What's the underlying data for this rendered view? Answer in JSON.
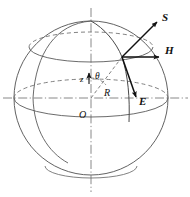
{
  "figure": {
    "kind": "sphere-vector-diagram",
    "title": "",
    "background": "#ffffff",
    "stroke_color": "#555555",
    "axis_color": "#777777",
    "vector_color": "#111111",
    "text_color": "#111111"
  },
  "sphere": {
    "center_x": 91,
    "center_y": 98,
    "radius": 77,
    "outline_style": "solid",
    "latitude_circles": [
      {
        "name": "upper-latitude",
        "cy": 47,
        "rx": 62,
        "ry": 15,
        "front": "solid",
        "back": "dashed"
      },
      {
        "name": "equator",
        "cy": 98,
        "rx": 77,
        "ry": 19,
        "front": "solid",
        "back": "dashed"
      },
      {
        "name": "lower-latitude",
        "cy": 168,
        "rx": 46,
        "ry": 12,
        "front": "solid",
        "back": "none"
      }
    ]
  },
  "axes": [
    {
      "name": "z-axis",
      "orientation": "vertical",
      "style": "dash-dot",
      "x": 91,
      "y1": 8,
      "y2": 192
    },
    {
      "name": "horizontal-axis",
      "orientation": "horizontal",
      "style": "dash-dot",
      "y": 98,
      "x1": 3,
      "x2": 188
    }
  ],
  "meridian": {
    "name": "meridian-arc",
    "from": "north-pole",
    "to": "surface-point",
    "style": "solid"
  },
  "surface_point": {
    "x": 122,
    "y": 57
  },
  "origin_point": {
    "x": 91,
    "y": 98
  },
  "radius_line": {
    "name": "radius-R",
    "style": "dashed",
    "from_origin": true
  },
  "angle_arc": {
    "name": "theta-arc",
    "style": "dashed",
    "between": [
      "z-axis",
      "radius-R"
    ]
  },
  "vectors": [
    {
      "id": "S",
      "label": "S",
      "dx": 38,
      "dy": -38,
      "head": "filled-arrow",
      "label_x": 165,
      "label_y": 17
    },
    {
      "id": "H",
      "label": "H",
      "dx": 50,
      "dy": 0,
      "head": "filled-arrow",
      "label_x": 168,
      "label_y": 50
    },
    {
      "id": "E",
      "label": "E",
      "dx": 16,
      "dy": 44,
      "head": "filled-arrow",
      "label_x": 142,
      "label_y": 100
    }
  ],
  "labels": [
    {
      "id": "z",
      "text": "z",
      "x": 82,
      "y": 79,
      "italic": true,
      "bold": false
    },
    {
      "id": "theta",
      "text": "θ",
      "x": 96,
      "y": 76,
      "italic": true,
      "bold": false
    },
    {
      "id": "R",
      "text": "R",
      "x": 106,
      "y": 93,
      "italic": true,
      "bold": false
    },
    {
      "id": "O",
      "text": "O",
      "x": 81,
      "y": 115,
      "italic": true,
      "bold": false
    },
    {
      "id": "S",
      "text": "S",
      "x": 163,
      "y": 20,
      "italic": true,
      "bold": true
    },
    {
      "id": "H",
      "text": "H",
      "x": 166,
      "y": 53,
      "italic": true,
      "bold": true
    },
    {
      "id": "E",
      "text": "E",
      "x": 141,
      "y": 103,
      "italic": true,
      "bold": true
    }
  ]
}
